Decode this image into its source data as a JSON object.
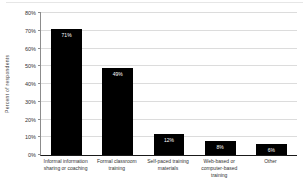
{
  "chart_data": {
    "type": "bar",
    "title": "",
    "xlabel": "",
    "ylabel": "Percent of respondents",
    "ylim": [
      0,
      80
    ],
    "ytick_step": 10,
    "yticks": [
      "0%",
      "10%",
      "20%",
      "30%",
      "40%",
      "50%",
      "60%",
      "70%",
      "80%"
    ],
    "grid": true,
    "legend": "none",
    "categories": [
      "Informal information sharing or coaching",
      "Formal classroom training",
      "Self-paced training materials",
      "Web-based or computer-based training",
      "Other"
    ],
    "values": [
      71,
      49,
      12,
      8,
      6
    ],
    "bar_labels": [
      "71%",
      "49%",
      "12%",
      "8%",
      "6%"
    ],
    "bar_color": "#000000",
    "bar_label_color": "#ffffff",
    "grid_color": "#dcdcdc",
    "axis_color": "#1a1a1a",
    "background_color": "#ffffff"
  }
}
